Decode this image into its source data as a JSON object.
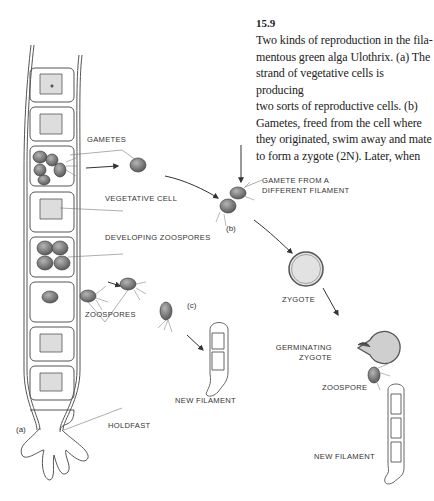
{
  "figure": {
    "number": "15.9",
    "caption": "Two kinds of reproduction in the filamentous green alga Ulothrix. (a) The strand of vegetative cells is producing two sorts of reproductive cells. (b) Gametes, freed from the cell where they originated, swim away and mate to form a zygote (2N). Later, when",
    "caption_lines": [
      "Two kinds of reproduction in the fila-",
      "mentous green alga Ulothrix. (a) The",
      "strand of vegetative cells is producing",
      "two sorts of reproductive cells. (b)",
      "Gametes, freed from the cell where",
      "they originated, swim away and mate",
      "to form a zygote (2N). Later, when"
    ]
  },
  "labels": {
    "gametes": "GAMETES",
    "vegetative_cell": "VEGETATIVE CELL",
    "developing_zoospores": "DEVELOPING ZOOSPORES",
    "zoospores": "ZOOSPORES",
    "new_filament_c": "NEW FILAMENT",
    "holdfast": "HOLDFAST",
    "gamete_from_different_1": "GAMETE FROM A",
    "gamete_from_different_2": "DIFFERENT FILAMENT",
    "zygote": "ZYGOTE",
    "germinating_1": "GERMINATING",
    "germinating_2": "ZYGOTE",
    "zoospore": "ZOOSPORE",
    "new_filament_b": "NEW FILAMENT"
  },
  "parts": {
    "a": "(a)",
    "b": "(b)",
    "c": "(c)"
  },
  "colors": {
    "line": "#444444",
    "cell_fill": "#8a8a8a",
    "zygote_fill": "#e2e2e2"
  }
}
